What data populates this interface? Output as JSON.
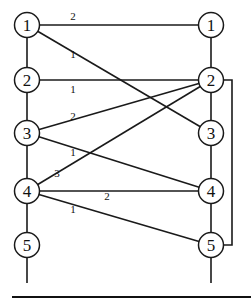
{
  "diagram": {
    "type": "bipartite-graph",
    "left_nodes": [
      {
        "id": "L1",
        "label": "1"
      },
      {
        "id": "L2",
        "label": "2"
      },
      {
        "id": "L3",
        "label": "3"
      },
      {
        "id": "L4",
        "label": "4"
      },
      {
        "id": "L5",
        "label": "5"
      }
    ],
    "right_nodes": [
      {
        "id": "R1",
        "label": "1"
      },
      {
        "id": "R2",
        "label": "2"
      },
      {
        "id": "R3",
        "label": "3"
      },
      {
        "id": "R4",
        "label": "4"
      },
      {
        "id": "R5",
        "label": "5"
      }
    ],
    "edges": [
      {
        "from": "L1",
        "to": "R1",
        "weight": "2"
      },
      {
        "from": "L1",
        "to": "R3",
        "weight": "1"
      },
      {
        "from": "L2",
        "to": "R2",
        "weight": "1"
      },
      {
        "from": "L3",
        "to": "R2",
        "weight": "2"
      },
      {
        "from": "L3",
        "to": "R4",
        "weight": "1"
      },
      {
        "from": "L4",
        "to": "R2",
        "weight": "3"
      },
      {
        "from": "L4",
        "to": "R4",
        "weight": "2"
      },
      {
        "from": "L4",
        "to": "R5",
        "weight": "1"
      }
    ],
    "bracket": {
      "from": "R2",
      "to": "R5"
    }
  }
}
